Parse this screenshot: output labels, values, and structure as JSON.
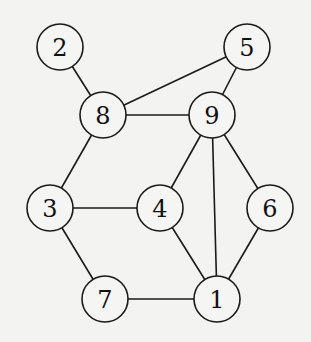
{
  "graph": {
    "nodes": [
      {
        "id": "1",
        "label": "1",
        "x": 217,
        "y": 299
      },
      {
        "id": "2",
        "label": "2",
        "x": 60,
        "y": 47
      },
      {
        "id": "3",
        "label": "3",
        "x": 50,
        "y": 208
      },
      {
        "id": "4",
        "label": "4",
        "x": 160,
        "y": 208
      },
      {
        "id": "5",
        "label": "5",
        "x": 247,
        "y": 47
      },
      {
        "id": "6",
        "label": "6",
        "x": 270,
        "y": 208
      },
      {
        "id": "7",
        "label": "7",
        "x": 105,
        "y": 299
      },
      {
        "id": "8",
        "label": "8",
        "x": 103,
        "y": 115
      },
      {
        "id": "9",
        "label": "9",
        "x": 212,
        "y": 115
      }
    ],
    "edges": [
      [
        "2",
        "8"
      ],
      [
        "5",
        "8"
      ],
      [
        "5",
        "9"
      ],
      [
        "8",
        "9"
      ],
      [
        "8",
        "3"
      ],
      [
        "9",
        "4"
      ],
      [
        "9",
        "1"
      ],
      [
        "9",
        "6"
      ],
      [
        "3",
        "4"
      ],
      [
        "3",
        "7"
      ],
      [
        "4",
        "1"
      ],
      [
        "6",
        "1"
      ],
      [
        "7",
        "1"
      ]
    ],
    "node_radius": 23
  }
}
